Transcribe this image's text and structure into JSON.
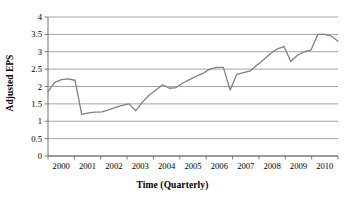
{
  "chart_data": {
    "type": "line",
    "title": "",
    "xlabel": "Time (Quarterly)",
    "ylabel": "Adjusted EPS",
    "ylim": [
      0,
      4
    ],
    "ytick_labels": [
      "0",
      "0.5",
      "1",
      "1.5",
      "2",
      "2.5",
      "3",
      "3.5",
      "4"
    ],
    "ytick_values": [
      0,
      0.5,
      1,
      1.5,
      2,
      2.5,
      3,
      3.5,
      4
    ],
    "xtick_labels": [
      "2000",
      "2001",
      "2002",
      "2003",
      "2004",
      "2005",
      "2006",
      "2007",
      "2008",
      "2009",
      "2010"
    ],
    "xtick_values": [
      2000,
      2001,
      2002,
      2003,
      2004,
      2005,
      2006,
      2007,
      2008,
      2009,
      2010
    ],
    "xlim": [
      2000,
      2010.75
    ],
    "grid": "horizontal",
    "legend": "none",
    "line_color": "#808080",
    "series": [
      {
        "name": "Adjusted EPS",
        "x": [
          2000.0,
          2000.25,
          2000.5,
          2000.75,
          2001.0,
          2001.25,
          2001.5,
          2001.75,
          2002.0,
          2002.25,
          2002.5,
          2002.75,
          2003.0,
          2003.25,
          2003.5,
          2003.75,
          2004.0,
          2004.25,
          2004.5,
          2004.75,
          2005.0,
          2005.25,
          2005.5,
          2005.75,
          2006.0,
          2006.25,
          2006.5,
          2006.75,
          2007.0,
          2007.25,
          2007.5,
          2007.75,
          2008.0,
          2008.25,
          2008.5,
          2008.75,
          2009.0,
          2009.25,
          2009.5,
          2009.75,
          2010.0,
          2010.25,
          2010.5,
          2010.75
        ],
        "values": [
          1.85,
          2.12,
          2.2,
          2.22,
          2.18,
          1.2,
          1.24,
          1.26,
          1.27,
          1.33,
          1.4,
          1.46,
          1.5,
          1.3,
          1.55,
          1.75,
          1.9,
          2.05,
          1.95,
          1.97,
          2.1,
          2.2,
          2.3,
          2.38,
          2.5,
          2.55,
          2.55,
          1.9,
          2.35,
          2.4,
          2.45,
          2.62,
          2.78,
          2.95,
          3.08,
          3.15,
          2.72,
          2.9,
          3.0,
          3.05,
          3.5,
          3.5,
          3.45,
          3.3
        ]
      }
    ]
  }
}
